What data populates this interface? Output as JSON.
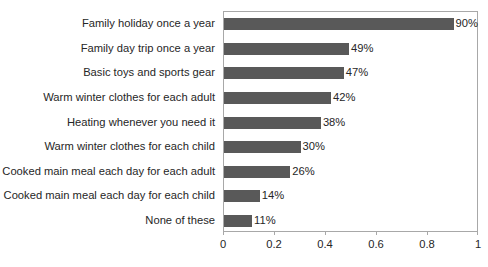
{
  "title_sliver": "",
  "chart_data": {
    "type": "bar",
    "orientation": "horizontal",
    "title": "",
    "xlabel": "",
    "ylabel": "",
    "xlim": [
      0,
      1
    ],
    "grid": false,
    "legend": "none",
    "bar_color": "#595959",
    "axis_color": "#a8a8a8",
    "text_color": "#262626",
    "background": "#ffffff",
    "xticks": [
      "0",
      "0.2",
      "0.4",
      "0.6",
      "0.8",
      "1"
    ],
    "xtick_values": [
      0,
      0.2,
      0.4,
      0.6,
      0.8,
      1
    ],
    "categories": [
      "Family holiday once a year",
      "Family day trip once a year",
      "Basic toys and sports gear",
      "Warm winter clothes for each adult",
      "Heating whenever you need it",
      "Warm winter clothes for each child",
      "Cooked main meal each day for each adult",
      "Cooked main meal each day for each child",
      "None of these"
    ],
    "values": [
      0.9,
      0.49,
      0.47,
      0.42,
      0.38,
      0.3,
      0.26,
      0.14,
      0.11
    ],
    "data_labels": [
      "90%",
      "49%",
      "47%",
      "42%",
      "38%",
      "30%",
      "26%",
      "14%",
      "11%"
    ]
  }
}
